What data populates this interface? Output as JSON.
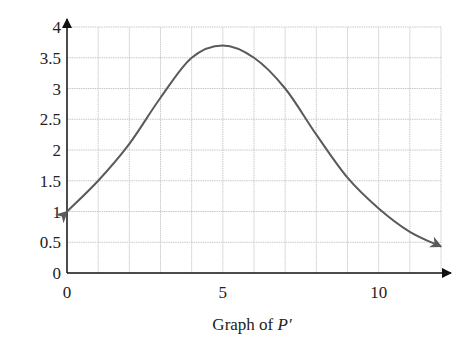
{
  "chart_data": {
    "type": "line",
    "title": "",
    "caption": "Graph of P′",
    "caption_prefix": "Graph of ",
    "caption_var": "P′",
    "xlabel": "",
    "ylabel": "",
    "xlim": [
      0,
      12
    ],
    "ylim": [
      0,
      4
    ],
    "x_ticks": [
      0,
      5,
      10
    ],
    "x_tick_labels": [
      "0",
      "5",
      "10"
    ],
    "y_ticks": [
      0,
      0.5,
      1,
      1.5,
      2,
      2.5,
      3,
      3.5,
      4
    ],
    "y_tick_labels": [
      "0",
      "0.5",
      "1",
      "1.5",
      "2",
      "2.5",
      "3",
      "3.5",
      "4"
    ],
    "grid": true,
    "grid_x_step": 1,
    "grid_y_step": 0.5,
    "series": [
      {
        "name": "P'",
        "x": [
          0,
          1,
          2,
          3,
          4,
          5,
          6,
          7,
          8,
          9,
          10,
          11,
          12
        ],
        "values": [
          1.0,
          1.5,
          2.1,
          2.85,
          3.5,
          3.7,
          3.5,
          3.0,
          2.25,
          1.55,
          1.05,
          0.67,
          0.43
        ],
        "color": "#5a5a5a",
        "arrow_both_ends": true
      }
    ]
  }
}
